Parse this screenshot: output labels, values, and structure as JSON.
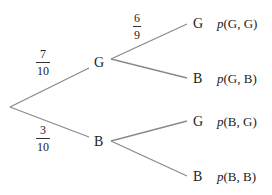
{
  "diagram": {
    "type": "probability-tree",
    "stroke_color": "#8a8a8a",
    "text_color": "#222222",
    "first_stage": {
      "branches": [
        {
          "outcome": "G",
          "probability": {
            "num": "7",
            "den": "10"
          }
        },
        {
          "outcome": "B",
          "probability": {
            "num": "3",
            "den": "10"
          }
        }
      ]
    },
    "second_stage": {
      "from_G": {
        "label_probability": {
          "num": "6",
          "den": "9"
        },
        "branches": [
          {
            "outcome": "G",
            "joint_label": {
              "p": "p",
              "args": "(G, G)"
            }
          },
          {
            "outcome": "B",
            "joint_label": {
              "p": "p",
              "args": "(G, B)"
            }
          }
        ]
      },
      "from_B": {
        "branches": [
          {
            "outcome": "G",
            "joint_label": {
              "p": "p",
              "args": "(B, G)"
            }
          },
          {
            "outcome": "B",
            "joint_label": {
              "p": "p",
              "args": "(B, B)"
            }
          }
        ]
      }
    }
  }
}
